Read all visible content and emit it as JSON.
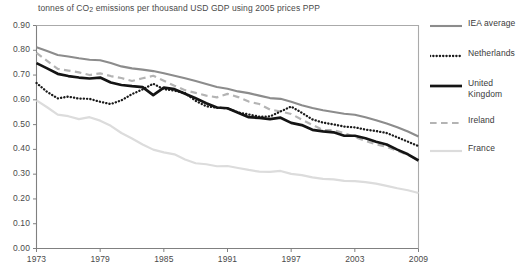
{
  "chart_data": {
    "type": "line",
    "title": "tonnes of CO2 emissions per thousand USD GDP using 2005 prices PPP",
    "title_prefix": "tonnes of CO",
    "title_sub": "2",
    "title_suffix": " emissions per thousand USD GDP using 2005 prices PPP",
    "xlabel": "",
    "ylabel": "",
    "xlim": [
      1973,
      2009
    ],
    "ylim": [
      0.0,
      0.9
    ],
    "grid": false,
    "legend_position": "right",
    "ytick_labels": [
      "0.90",
      "0.80",
      "0.70",
      "0.60",
      "0.50",
      "0.40",
      "0.30",
      "0.20",
      "0.10",
      "0.00"
    ],
    "ytick_values": [
      0.9,
      0.8,
      0.7,
      0.6,
      0.5,
      0.4,
      0.3,
      0.2,
      0.1,
      0.0
    ],
    "xtick_labels": [
      "1973",
      "1979",
      "1985",
      "1991",
      "1997",
      "2003",
      "2009"
    ],
    "xtick_values": [
      1973,
      1979,
      1985,
      1991,
      1997,
      2003,
      2009
    ],
    "x": [
      1973,
      1974,
      1975,
      1976,
      1977,
      1978,
      1979,
      1980,
      1981,
      1982,
      1983,
      1984,
      1985,
      1986,
      1987,
      1988,
      1989,
      1990,
      1991,
      1992,
      1993,
      1994,
      1995,
      1996,
      1997,
      1998,
      1999,
      2000,
      2001,
      2002,
      2003,
      2004,
      2005,
      2006,
      2007,
      2008,
      2009
    ],
    "series": [
      {
        "name": "IEA average",
        "style": "solid",
        "color": "#8c8c8c",
        "width": 2.1,
        "values": [
          0.812,
          0.797,
          0.781,
          0.775,
          0.768,
          0.762,
          0.76,
          0.749,
          0.735,
          0.727,
          0.722,
          0.716,
          0.707,
          0.697,
          0.687,
          0.676,
          0.664,
          0.652,
          0.645,
          0.634,
          0.627,
          0.617,
          0.607,
          0.604,
          0.592,
          0.578,
          0.567,
          0.558,
          0.551,
          0.544,
          0.54,
          0.53,
          0.518,
          0.504,
          0.489,
          0.472,
          0.452
        ]
      },
      {
        "name": "Netherlands",
        "style": "dotted",
        "color": "#1a1a1a",
        "width": 2.3,
        "values": [
          0.668,
          0.632,
          0.606,
          0.613,
          0.605,
          0.604,
          0.592,
          0.583,
          0.598,
          0.623,
          0.642,
          0.665,
          0.643,
          0.637,
          0.627,
          0.596,
          0.574,
          0.568,
          0.566,
          0.549,
          0.541,
          0.532,
          0.533,
          0.553,
          0.573,
          0.548,
          0.521,
          0.508,
          0.501,
          0.492,
          0.489,
          0.48,
          0.474,
          0.466,
          0.449,
          0.431,
          0.413
        ]
      },
      {
        "name": "United Kingdom",
        "style": "solid",
        "color": "#141414",
        "width": 2.7,
        "values": [
          0.748,
          0.727,
          0.705,
          0.696,
          0.69,
          0.686,
          0.69,
          0.67,
          0.66,
          0.655,
          0.651,
          0.619,
          0.649,
          0.643,
          0.625,
          0.606,
          0.586,
          0.569,
          0.566,
          0.548,
          0.53,
          0.527,
          0.522,
          0.528,
          0.507,
          0.498,
          0.479,
          0.473,
          0.469,
          0.455,
          0.455,
          0.445,
          0.431,
          0.42,
          0.399,
          0.38,
          0.355
        ]
      },
      {
        "name": "Ireland",
        "style": "dashed",
        "color": "#b4b4b4",
        "width": 2.2,
        "values": [
          0.79,
          0.757,
          0.725,
          0.718,
          0.711,
          0.7,
          0.707,
          0.696,
          0.688,
          0.676,
          0.687,
          0.697,
          0.677,
          0.657,
          0.639,
          0.628,
          0.617,
          0.61,
          0.624,
          0.611,
          0.593,
          0.583,
          0.561,
          0.553,
          0.543,
          0.52,
          0.499,
          0.478,
          0.478,
          0.466,
          0.45,
          0.434,
          0.421,
          0.41,
          0.394,
          0.378,
          0.357
        ]
      },
      {
        "name": "France",
        "style": "solid",
        "color": "#dcdcdc",
        "width": 2.2,
        "values": [
          0.598,
          0.57,
          0.54,
          0.534,
          0.522,
          0.53,
          0.516,
          0.495,
          0.466,
          0.444,
          0.42,
          0.399,
          0.388,
          0.38,
          0.359,
          0.344,
          0.34,
          0.332,
          0.333,
          0.325,
          0.317,
          0.31,
          0.309,
          0.313,
          0.301,
          0.296,
          0.287,
          0.281,
          0.279,
          0.273,
          0.272,
          0.268,
          0.262,
          0.253,
          0.243,
          0.235,
          0.224
        ]
      }
    ]
  },
  "legend": {
    "entries": [
      {
        "label": "IEA average"
      },
      {
        "label": "Netherlands"
      },
      {
        "label": "United\nKingdom"
      },
      {
        "label": "Ireland"
      },
      {
        "label": "France"
      }
    ]
  }
}
